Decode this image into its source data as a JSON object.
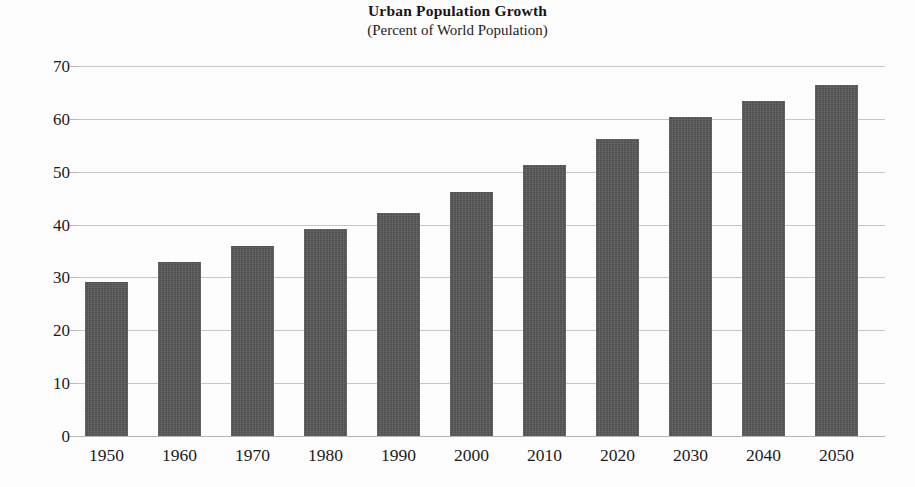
{
  "chart_data": {
    "type": "bar",
    "title": "Urban Population Growth",
    "subtitle": "(Percent of World Population)",
    "xlabel": "",
    "ylabel": "",
    "categories": [
      "1950",
      "1960",
      "1970",
      "1980",
      "1990",
      "2000",
      "2010",
      "2020",
      "2030",
      "2040",
      "2050"
    ],
    "values": [
      29.2,
      33.0,
      36.0,
      39.1,
      42.2,
      46.2,
      51.3,
      56.2,
      60.3,
      63.3,
      66.5
    ],
    "ylim": [
      0,
      70
    ],
    "ytick_labels": [
      "0",
      "10",
      "20",
      "30",
      "40",
      "50",
      "60",
      "70"
    ],
    "ytick_values": [
      0,
      10,
      20,
      30,
      40,
      50,
      60,
      70
    ],
    "grid": true,
    "grid_axis": "y",
    "legend": false,
    "legend_position": "none",
    "bar_color": "#585858",
    "grid_color": "#c6c6c6",
    "background_color": "#fdfdfd",
    "text_color": "#1b1b1b"
  }
}
